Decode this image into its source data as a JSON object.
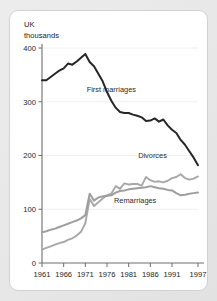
{
  "card": {
    "background_color": "#ffffff",
    "page_background_color": "#e9e9e9"
  },
  "chart_data": {
    "type": "line",
    "title": "",
    "subtitle": "",
    "unit_label_line1": "UK",
    "unit_label_line2": "thousands",
    "xlabel": "",
    "ylabel": "",
    "ylim": [
      0,
      400
    ],
    "xlim": [
      1961,
      1997
    ],
    "ytick_labels": [
      "0",
      "100",
      "200",
      "300",
      "400"
    ],
    "yticks": [
      0,
      100,
      200,
      300,
      400
    ],
    "xtick_labels": [
      "1961",
      "1966",
      "1971",
      "1976",
      "1981",
      "1986",
      "1991",
      "1997"
    ],
    "xticks": [
      1961,
      1966,
      1971,
      1976,
      1981,
      1986,
      1991,
      1997
    ],
    "grid": "horizontal",
    "legend_position": "inline-annotations",
    "x": [
      1961,
      1962,
      1963,
      1964,
      1965,
      1966,
      1967,
      1968,
      1969,
      1970,
      1971,
      1972,
      1973,
      1974,
      1975,
      1976,
      1977,
      1978,
      1979,
      1980,
      1981,
      1982,
      1983,
      1984,
      1985,
      1986,
      1987,
      1988,
      1989,
      1990,
      1991,
      1992,
      1993,
      1994,
      1995,
      1996,
      1997
    ],
    "series": [
      {
        "name": "First marriages",
        "color": "#262626",
        "width": 2.0,
        "label_text": "First marriages",
        "values": [
          340,
          340,
          346,
          352,
          358,
          362,
          371,
          369,
          375,
          382,
          389,
          374,
          366,
          352,
          338,
          318,
          302,
          289,
          281,
          279,
          279,
          276,
          274,
          271,
          264,
          265,
          269,
          263,
          267,
          256,
          248,
          242,
          229,
          220,
          208,
          196,
          182
        ]
      },
      {
        "name": "Divorces",
        "color": "#a8a8a8",
        "width": 1.9,
        "label_text": "Divorces",
        "values": [
          25,
          28,
          31,
          34,
          37,
          39,
          43,
          46,
          51,
          58,
          74,
          119,
          106,
          113,
          120,
          126,
          129,
          143,
          138,
          148,
          146,
          147,
          147,
          144,
          160,
          154,
          151,
          152,
          150,
          153,
          158,
          160,
          165,
          158,
          155,
          157,
          161
        ]
      },
      {
        "name": "Remarriages",
        "color": "#9e9e9e",
        "width": 2.0,
        "label_text": "Remarriages",
        "values": [
          57,
          59,
          62,
          64,
          67,
          70,
          73,
          76,
          79,
          83,
          89,
          129,
          116,
          122,
          124,
          125,
          126,
          131,
          134,
          135,
          137,
          138,
          139,
          140,
          141,
          143,
          141,
          139,
          138,
          136,
          135,
          130,
          126,
          127,
          129,
          130,
          131
        ]
      }
    ],
    "annotations": [
      {
        "text": "First marriages",
        "x": 1977,
        "y": 318
      },
      {
        "text": "Divorces",
        "x": 1986.5,
        "y": 196
      },
      {
        "text": "Remarriages",
        "x": 1982.5,
        "y": 112
      }
    ]
  }
}
